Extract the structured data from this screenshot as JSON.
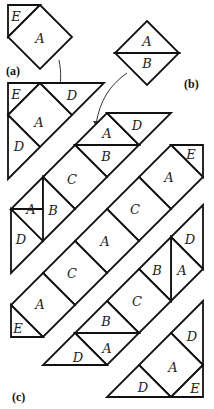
{
  "figure": {
    "captions": {
      "a": "(a)",
      "b": "(b)",
      "c": "(c)"
    },
    "piece_a": {
      "labels": {
        "top_triangle": "E",
        "square": "A"
      }
    },
    "piece_b": {
      "labels": {
        "upper_triangle": "A",
        "lower_triangle": "B"
      }
    },
    "strip1": {
      "labels": [
        "E",
        "A",
        "D",
        "D"
      ]
    },
    "strip2": {
      "labels": [
        "A",
        "D",
        "B",
        "C",
        "A",
        "B",
        "D"
      ]
    },
    "strip3": {
      "labels": [
        "E",
        "A",
        "C",
        "A",
        "C",
        "A",
        "E"
      ]
    },
    "strip4": {
      "labels": [
        "D",
        "A",
        "B",
        "C",
        "B",
        "A",
        "D"
      ]
    },
    "strip5": {
      "labels": [
        "D",
        "A",
        "E",
        "D"
      ]
    },
    "colors": {
      "line": "#111111",
      "background": "#ffffff"
    }
  }
}
